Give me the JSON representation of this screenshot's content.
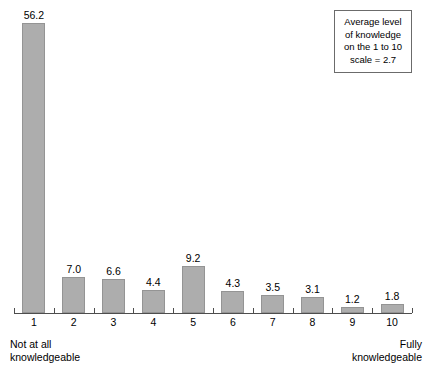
{
  "chart_data": {
    "type": "bar",
    "title": "",
    "subtitle": "",
    "xlabel": "",
    "ylabel": "",
    "grid": false,
    "legend": "none",
    "ylim": [
      0,
      60
    ],
    "categories": [
      "1",
      "2",
      "3",
      "4",
      "5",
      "6",
      "7",
      "8",
      "9",
      "10"
    ],
    "values": [
      56.2,
      7.0,
      6.6,
      4.4,
      9.2,
      4.3,
      3.5,
      3.1,
      1.2,
      1.8
    ],
    "value_labels": [
      "56.2",
      "7.0",
      "6.6",
      "4.4",
      "9.2",
      "4.3",
      "3.5",
      "3.1",
      "1.2",
      "1.8"
    ],
    "tick_labels": [
      "1",
      "2",
      "3",
      "4",
      "5",
      "6",
      "7",
      "8",
      "9",
      "10"
    ],
    "axis_endpoint_labels": {
      "left": [
        "Not at all",
        "knowledgeable"
      ],
      "right": [
        "Fully",
        "knowledgeable"
      ]
    },
    "annotation": {
      "lines": [
        "Average level",
        "of knowledge",
        "on the 1 to 10",
        "scale = 2.7"
      ]
    },
    "colors": {
      "bar_fill": "#adadad",
      "bar_stroke": "#949494",
      "axis": "#4d4d4d",
      "text": "#000000",
      "background": "#ffffff",
      "annotation_border": "#6b6b6b"
    }
  }
}
